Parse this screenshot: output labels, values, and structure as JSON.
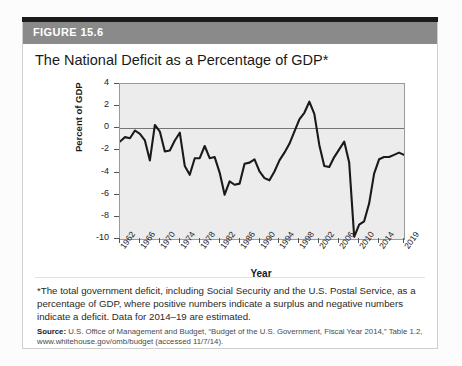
{
  "figure": {
    "badge": "FIGURE 15.6",
    "title": "The National Deficit as a Percentage of GDP*"
  },
  "notes": {
    "footnote": "*The total government deficit, including Social Security and the U.S. Postal Service, as a percentage of GDP, where positive numbers indicate a surplus and negative numbers indicate a deficit. Data for 2014–19 are estimated.",
    "source_label": "Source:",
    "source_text": " U.S. Office of Management and Budget, “Budget of the U.S. Government, Fiscal Year 2014,” Table 1.2, www.whitehouse.gov/omb/budget (accessed 11/7/14)."
  },
  "colors": {
    "header_bar": "#8a8a8a",
    "plot_background": "#ececec",
    "line": "#1a1a1a",
    "axis": "#555555"
  },
  "chart_data": {
    "type": "line",
    "title": "The National Deficit as a Percentage of GDP*",
    "xlabel": "Year",
    "ylabel": "Percent of GDP",
    "xlim": [
      1962,
      2019
    ],
    "ylim": [
      -10,
      4
    ],
    "yticks": [
      4,
      2,
      0,
      -2,
      -4,
      -6,
      -8,
      -10
    ],
    "xticks": [
      1962,
      1966,
      1970,
      1974,
      1978,
      1982,
      1986,
      1990,
      1994,
      1998,
      2002,
      2006,
      2010,
      2014,
      2019
    ],
    "grid": false,
    "legend": "none",
    "zero_reference_line": 0,
    "x": [
      1962,
      1963,
      1964,
      1965,
      1966,
      1967,
      1968,
      1969,
      1970,
      1971,
      1972,
      1973,
      1974,
      1975,
      1976,
      1977,
      1978,
      1979,
      1980,
      1981,
      1982,
      1983,
      1984,
      1985,
      1986,
      1987,
      1988,
      1989,
      1990,
      1991,
      1992,
      1993,
      1994,
      1995,
      1996,
      1997,
      1998,
      1999,
      2000,
      2001,
      2002,
      2003,
      2004,
      2005,
      2006,
      2007,
      2008,
      2009,
      2010,
      2011,
      2012,
      2013,
      2014,
      2015,
      2016,
      2017,
      2018,
      2019
    ],
    "values": [
      -1.2,
      -0.8,
      -0.9,
      -0.2,
      -0.5,
      -1.1,
      -2.9,
      0.3,
      -0.3,
      -2.1,
      -2.0,
      -1.1,
      -0.4,
      -3.4,
      -4.2,
      -2.7,
      -2.7,
      -1.6,
      -2.7,
      -2.6,
      -4.0,
      -6.0,
      -4.8,
      -5.1,
      -5.0,
      -3.2,
      -3.1,
      -2.8,
      -3.9,
      -4.5,
      -4.7,
      -3.9,
      -2.9,
      -2.2,
      -1.4,
      -0.3,
      0.8,
      1.4,
      2.4,
      1.3,
      -1.5,
      -3.4,
      -3.5,
      -2.6,
      -1.9,
      -1.2,
      -3.1,
      -9.8,
      -8.7,
      -8.4,
      -6.8,
      -4.1,
      -2.8,
      -2.6,
      -2.6,
      -2.4,
      -2.2,
      -2.4
    ],
    "annotations": [
      {
        "label": "surplus peak",
        "x": 2000,
        "y": 2.4
      },
      {
        "label": "deepest deficit",
        "x": 2009,
        "y": -9.8
      }
    ]
  }
}
